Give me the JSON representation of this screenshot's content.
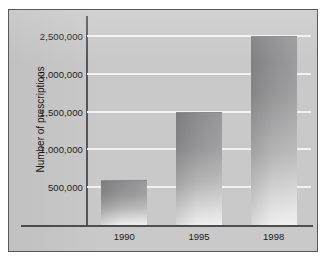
{
  "chart_data": {
    "type": "bar",
    "title": "",
    "xlabel": "",
    "ylabel": "Number of prescriptions",
    "categories": [
      "1990",
      "1995",
      "1998"
    ],
    "values": [
      600000,
      1500000,
      2500000
    ],
    "ylim": [
      0,
      2750000
    ],
    "yticks": [
      500000,
      1000000,
      1500000,
      2000000,
      2500000
    ],
    "ytick_labels": [
      "500,000",
      "1,000,000",
      "1,500,000",
      "2,000,000",
      "2,500,000"
    ],
    "grid": "horizontal",
    "gridline_color": "#f2f2f2",
    "legend": "none",
    "bar_color": "#8b8b8d",
    "background_color": "#c9c9c9",
    "axis_color": "#555557"
  }
}
